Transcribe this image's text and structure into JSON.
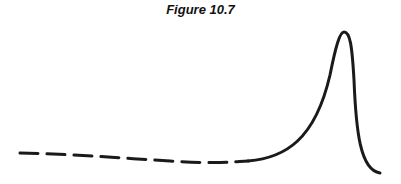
{
  "figure": {
    "title": "Figure 10.7",
    "stroke_color": "#1a1a1a",
    "dashed_segment": "M 20 153 C 70 154, 120 158, 170 161 S 230 162, 248 161",
    "solid_segment": "M 248 161 C 285 158, 315 140, 330 75 C 336 45, 340 32, 344 32 C 350 32, 352 45, 354 80 C 356 130, 360 170, 380 173"
  }
}
